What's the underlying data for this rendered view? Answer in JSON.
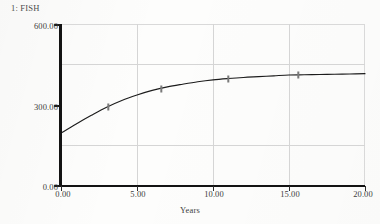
{
  "legend": {
    "entries": [
      {
        "key": "1",
        "label": "FISH",
        "text": "1: FISH"
      }
    ]
  },
  "axes": {
    "y": {
      "title": "",
      "min": 0,
      "max": 600,
      "tick_labels": [
        "600.00",
        "300.00",
        "0.00"
      ],
      "tick_values": [
        600,
        300,
        0
      ],
      "gridline_values": [
        450,
        150
      ]
    },
    "x": {
      "title": "Years",
      "min": 0,
      "max": 20,
      "tick_labels": [
        "0.00",
        "5.00",
        "10.00",
        "15.00",
        "20.00"
      ],
      "tick_values": [
        0,
        5,
        10,
        15,
        20
      ],
      "gridline_values": [
        5,
        10,
        15
      ]
    }
  },
  "colors": {
    "curve": "#1c1c1c",
    "axis": "#131313",
    "gridline": "#d5d5d5",
    "frame": "#d9d9d9",
    "text": "#3d3d3d",
    "marker": "#7a7a7a",
    "background": "#fdfdfc"
  },
  "chart_data": {
    "type": "line",
    "title": "",
    "subtitle": "",
    "xlabel": "Years",
    "ylabel": "",
    "xlim": [
      0,
      20
    ],
    "ylim": [
      0,
      600
    ],
    "grid": true,
    "legend_position": "top-left",
    "x_ticks": [
      0,
      5,
      10,
      15,
      20
    ],
    "x_tick_labels": [
      "0.00",
      "5.00",
      "10.00",
      "15.00",
      "20.00"
    ],
    "y_ticks": [
      0,
      300,
      600
    ],
    "y_tick_labels": [
      "0.00",
      "300.00",
      "600.00"
    ],
    "series": [
      {
        "name": "FISH",
        "key": "1",
        "marker_label": "1",
        "x": [
          0,
          1,
          2,
          3,
          4,
          5,
          6,
          7,
          8,
          9,
          10,
          11,
          12,
          13,
          14,
          15,
          16,
          17,
          18,
          19,
          20
        ],
        "values": [
          196,
          230,
          262,
          292,
          317,
          337,
          354,
          367,
          377,
          386,
          393,
          398,
          402,
          405,
          408,
          411,
          412,
          413,
          414,
          415,
          416
        ],
        "marker_points": [
          {
            "x": 0,
            "y": 196
          },
          {
            "x": 3.1,
            "y": 294
          },
          {
            "x": 6.6,
            "y": 360
          },
          {
            "x": 11.0,
            "y": 398
          },
          {
            "x": 15.6,
            "y": 411
          }
        ]
      }
    ],
    "annotations": []
  }
}
